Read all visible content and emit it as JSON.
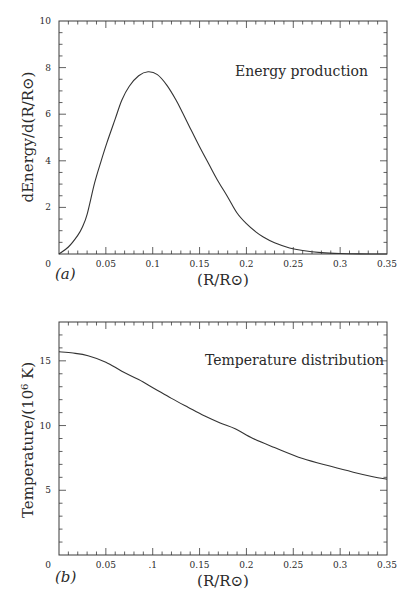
{
  "chart_data": [
    {
      "type": "line",
      "panel": "(a)",
      "title": "",
      "annotation": "Energy production",
      "xlabel": "(R/R⊙)",
      "ylabel": "dEnergy/d(R/R⊙)",
      "xlim": [
        0,
        0.35
      ],
      "ylim": [
        0,
        10
      ],
      "x_ticks": [
        0.05,
        0.1,
        0.15,
        0.2,
        0.25,
        0.3,
        0.35
      ],
      "x_tick_labels": [
        "0.05",
        "0.1",
        "0.15",
        "0.2",
        "0.25",
        "0.3",
        "0.35"
      ],
      "y_ticks": [
        0,
        2,
        4,
        6,
        8,
        10
      ],
      "y_tick_labels": [
        "0",
        "2",
        "4",
        "6",
        "8",
        "10"
      ],
      "origin_label": "0",
      "grid": false,
      "legend": null,
      "series": [
        {
          "name": "Energy production",
          "x": [
            0.0,
            0.01,
            0.02,
            0.025,
            0.03,
            0.038,
            0.045,
            0.051,
            0.06,
            0.067,
            0.075,
            0.085,
            0.095,
            0.105,
            0.115,
            0.125,
            0.132,
            0.14,
            0.15,
            0.16,
            0.169,
            0.18,
            0.19,
            0.2,
            0.21,
            0.218,
            0.23,
            0.246,
            0.26,
            0.28,
            0.3,
            0.32,
            0.35
          ],
          "y": [
            0.0,
            0.3,
            0.8,
            1.16,
            1.7,
            3.05,
            4.0,
            4.76,
            5.8,
            6.6,
            7.2,
            7.65,
            7.82,
            7.7,
            7.25,
            6.6,
            6.05,
            5.4,
            4.6,
            3.85,
            3.18,
            2.45,
            1.76,
            1.3,
            0.95,
            0.73,
            0.48,
            0.26,
            0.15,
            0.06,
            0.02,
            0.005,
            0.0
          ]
        }
      ]
    },
    {
      "type": "line",
      "panel": "(b)",
      "title": "",
      "annotation": "Temperature distribution",
      "xlabel": "(R/R⊙)",
      "ylabel": "Temperature/(10⁶ K)",
      "xlim": [
        0,
        0.35
      ],
      "ylim": [
        0,
        18
      ],
      "x_ticks": [
        0.05,
        0.1,
        0.15,
        0.2,
        0.25,
        0.3,
        0.35
      ],
      "x_tick_labels": [
        "0.05",
        ".1",
        "0.15",
        "0.2",
        "0.25",
        "0.3",
        "0.35"
      ],
      "y_ticks": [
        0,
        5,
        10,
        15
      ],
      "y_tick_labels": [
        "0",
        "5",
        "10",
        "15"
      ],
      "origin_label": "0",
      "grid": false,
      "legend": null,
      "series": [
        {
          "name": "Temperature distribution",
          "x": [
            0.0,
            0.015,
            0.031,
            0.05,
            0.067,
            0.085,
            0.102,
            0.12,
            0.138,
            0.155,
            0.172,
            0.188,
            0.207,
            0.23,
            0.26,
            0.29,
            0.314,
            0.335,
            0.35
          ],
          "y": [
            15.7,
            15.6,
            15.4,
            14.9,
            14.2,
            13.55,
            12.85,
            12.1,
            11.4,
            10.75,
            10.2,
            9.75,
            9.0,
            8.3,
            7.45,
            6.85,
            6.4,
            6.05,
            5.85
          ]
        }
      ]
    }
  ],
  "figure": {
    "panels": [
      {
        "id": "a",
        "panel_label": "(a)",
        "annotation": "Energy production",
        "xlabel": "(R/R⊙)",
        "ylabel": "dEnergy/d(R/R⊙)",
        "origin_label": "0"
      },
      {
        "id": "b",
        "panel_label": "(b)",
        "annotation": "Temperature distribution",
        "xlabel": "(R/R⊙)",
        "ylabel": "Temperature/(10⁶ K)",
        "origin_label": "0"
      }
    ],
    "colors": {
      "line": "#333333",
      "frame": "#3a3a3a",
      "text": "#2a2a2a",
      "background": "#ffffff"
    }
  }
}
